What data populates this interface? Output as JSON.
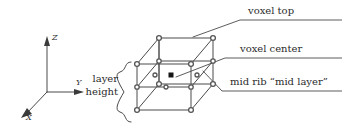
{
  "figure": {
    "background": "#ffffff",
    "line_color": "#4a4a4a",
    "marker_color": "#555555",
    "text_color": "#2b2b2b"
  },
  "axes": {
    "origin": [
      47,
      92
    ],
    "z": {
      "label": "Z",
      "tip": [
        47,
        38
      ]
    },
    "y": {
      "label": "Y",
      "tip": [
        84,
        92
      ]
    },
    "x": {
      "label": "X",
      "tip": [
        21,
        118
      ]
    }
  },
  "brace": {
    "label_line1": "layer",
    "label_line2": "height",
    "span_top": 62,
    "span_bottom": 126
  },
  "callouts": [
    {
      "name": "voxel-top",
      "text": "voxel top",
      "text_x": 248,
      "text_y": 6,
      "underline_y": 20,
      "underline_x1": 243,
      "underline_x2": 342,
      "leader": [
        [
          193,
          37
        ],
        [
          240,
          20
        ],
        [
          342,
          20
        ]
      ]
    },
    {
      "name": "voxel-center",
      "text": "voxel center",
      "text_x": 240,
      "text_y": 44,
      "underline_y": 58,
      "underline_x1": 228,
      "underline_x2": 342,
      "leader": [
        [
          180,
          80
        ],
        [
          225,
          58
        ],
        [
          342,
          58
        ]
      ]
    },
    {
      "name": "mid-rib",
      "text": "mid rib “mid layer”",
      "text_x": 234,
      "text_y": 84,
      "underline_y": 99,
      "underline_x1": 220,
      "underline_x2": 342,
      "leader": [
        [
          203,
          71
        ],
        [
          222,
          91
        ],
        [
          342,
          91
        ]
      ]
    }
  ],
  "voxel": {
    "description": "isometric cube with mid layer plane, circular node markers, one filled square center marker",
    "front_face": [
      [
        137,
        64
      ],
      [
        191,
        64
      ],
      [
        191,
        110
      ],
      [
        137,
        110
      ]
    ],
    "back_offset": [
      22,
      -26
    ],
    "mid_layer_y_front": 87,
    "center_marker": [
      171,
      75
    ],
    "node_marker_shape": "circle",
    "center_marker_shape": "filled-square"
  }
}
